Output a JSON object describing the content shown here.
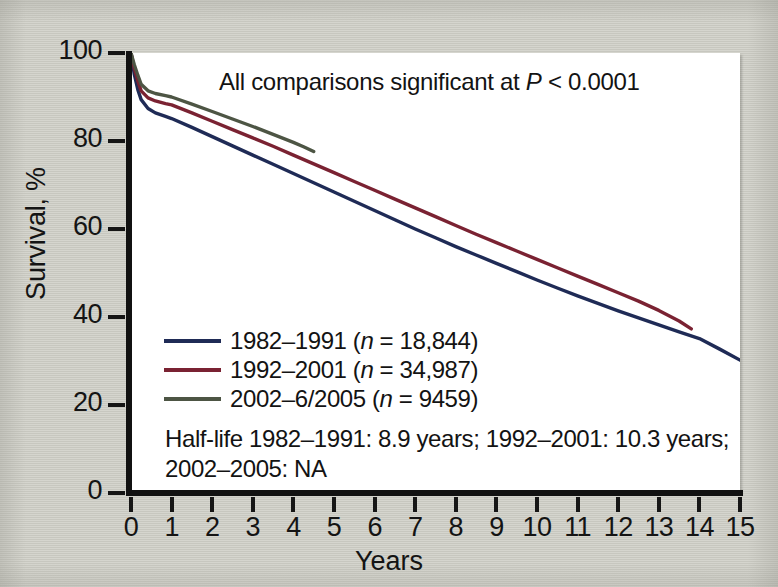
{
  "figure": {
    "background_color": "#cdcdc5",
    "plot_background_color": "#ffffff",
    "axis_color": "#111111"
  },
  "annotations": {
    "significance_prefix": "All comparisons significant at ",
    "significance_symbol": "P",
    "significance_suffix": " < 0.0001",
    "halflife_line1": "Half-life 1982–1991: 8.9 years; 1992–2001: 10.3 years;",
    "halflife_line2": "2002–2005: NA"
  },
  "legend": {
    "items": [
      {
        "label_prefix": "1982–1991 (",
        "label_symbol": "n",
        "label_suffix": " = 18,844)",
        "color": "#1f2b56"
      },
      {
        "label_prefix": "1992–2001 (",
        "label_symbol": "n",
        "label_suffix": " = 34,987)",
        "color": "#7a2232"
      },
      {
        "label_prefix": "2002–6/2005 (",
        "label_symbol": "n",
        "label_suffix": " = 9459)",
        "color": "#4d5544"
      }
    ]
  },
  "chart_data": {
    "type": "line",
    "title": "",
    "xlabel": "Years",
    "ylabel": "Survival, %",
    "xlim": [
      0,
      15
    ],
    "ylim": [
      0,
      100
    ],
    "grid": false,
    "legend_position": "inside-left",
    "xticks": [
      0,
      1,
      2,
      3,
      4,
      5,
      6,
      7,
      8,
      9,
      10,
      11,
      12,
      13,
      14,
      15
    ],
    "xtick_labels": [
      "0",
      "1",
      "2",
      "3",
      "4",
      "5",
      "6",
      "7",
      "8",
      "9",
      "10",
      "11",
      "12",
      "13",
      "14",
      "15"
    ],
    "yticks": [
      0,
      20,
      40,
      60,
      80,
      100
    ],
    "ytick_labels": [
      "0",
      "20",
      "40",
      "60",
      "80",
      "100"
    ],
    "series": [
      {
        "name": "1982–1991 (n = 18,844)",
        "color": "#1f2b56",
        "n": 18844,
        "half_life_years": 8.9,
        "x": [
          0,
          0.08,
          0.17,
          0.25,
          0.42,
          0.6,
          0.85,
          1,
          1.5,
          2,
          2.5,
          3,
          3.5,
          4,
          4.5,
          5,
          5.5,
          6,
          6.5,
          7,
          7.5,
          8,
          8.5,
          9,
          9.5,
          10,
          10.5,
          11,
          11.5,
          12,
          12.5,
          13,
          13.5,
          14,
          14.5,
          15
        ],
        "y": [
          100,
          95.2,
          91.6,
          89.4,
          87.4,
          86.4,
          85.6,
          85.1,
          83.1,
          81.0,
          78.9,
          76.8,
          74.7,
          72.6,
          70.5,
          68.4,
          66.3,
          64.2,
          62.1,
          60.0,
          58.0,
          56.0,
          54.1,
          52.2,
          50.3,
          48.4,
          46.6,
          44.8,
          43.1,
          41.4,
          39.8,
          38.2,
          36.6,
          35.1,
          32.7,
          30.2
        ]
      },
      {
        "name": "1992–2001 (n = 34,987)",
        "color": "#7a2232",
        "n": 34987,
        "half_life_years": 10.3,
        "x": [
          0,
          0.08,
          0.17,
          0.25,
          0.42,
          0.6,
          0.85,
          1,
          1.5,
          2,
          2.5,
          3,
          3.5,
          4,
          4.5,
          5,
          5.5,
          6,
          6.5,
          7,
          7.5,
          8,
          8.5,
          9,
          9.5,
          10,
          10.5,
          11,
          11.5,
          12,
          12.5,
          13,
          13.5,
          13.8
        ],
        "y": [
          100,
          96.5,
          93.6,
          91.4,
          89.8,
          89.1,
          88.5,
          88.2,
          86.4,
          84.5,
          82.6,
          80.7,
          78.8,
          76.8,
          74.8,
          72.8,
          70.8,
          68.8,
          66.8,
          64.8,
          62.8,
          60.8,
          58.8,
          56.9,
          55.0,
          53.1,
          51.2,
          49.3,
          47.4,
          45.5,
          43.6,
          41.5,
          39.1,
          37.3
        ]
      },
      {
        "name": "2002–6/2005 (n = 9459)",
        "color": "#4d5544",
        "n": 9459,
        "half_life_years": null,
        "half_life_label": "NA",
        "x": [
          0,
          0.08,
          0.17,
          0.25,
          0.42,
          0.6,
          0.85,
          1,
          1.5,
          2,
          2.5,
          3,
          3.5,
          4,
          4.25,
          4.5
        ],
        "y": [
          100,
          97.4,
          94.9,
          92.9,
          91.4,
          90.8,
          90.3,
          90.0,
          88.4,
          86.7,
          85.0,
          83.3,
          81.5,
          79.7,
          78.7,
          77.6
        ]
      }
    ]
  }
}
